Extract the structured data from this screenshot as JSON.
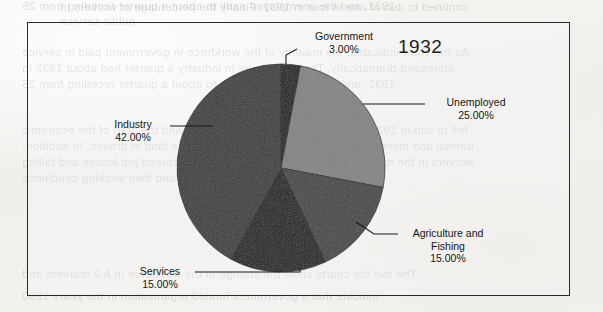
{
  "page": {
    "background_color": "#f4f3f1",
    "frame_color": "#2a2a2a"
  },
  "ghost_text": [
    "contined to duh of one in four in 1932. Finally the percentage of workers in",
    "public service",
    "As the chart indicates, the majority of the workforce in government paid in service",
    "increased dramatically. The percentage in industry  a quarter had about 1932 in",
    "1932,  and the unemployed sank to about a quarter receding from 25",
    "fell to sub in 1929, the year of the Wall Street crash and the start of the economic",
    "turmoil and more Jobless. Peasants were forced off the land in droves. In addition,",
    "workers in the manufacturing sector experienced widespread job losses and falling",
    "and their working conditions",
    "The two bie charts show the change of the workforce in A  2  markets and",
    "indicate that  a government funded organisation  in  the years 1990"
  ],
  "chart": {
    "title": "1932"
  },
  "chart_data": {
    "type": "pie",
    "title": "1932",
    "legend_position": "external-labels",
    "start_angle_deg": 0,
    "direction": "clockwise",
    "categories": [
      "Government",
      "Unemployed",
      "Agriculture and Fishing",
      "Services",
      "Industry"
    ],
    "values": [
      3,
      25,
      15,
      15,
      42
    ],
    "value_labels": [
      "3.00%",
      "25.00%",
      "15.00%",
      "15.00%",
      "42.00%"
    ],
    "unit": "%",
    "total": 100,
    "colors": [
      "#141414",
      "#838383",
      "#444444",
      "#1a1a1a",
      "#3a3a3a"
    ],
    "slices": [
      {
        "name": "Government",
        "label_lines": [
          "Government"
        ],
        "value": 3,
        "value_label": "3.00%",
        "color": "#141414"
      },
      {
        "name": "Unemployed",
        "label_lines": [
          "Unemployed"
        ],
        "value": 25,
        "value_label": "25.00%",
        "color": "#838383"
      },
      {
        "name": "Agriculture and Fishing",
        "label_lines": [
          "Agriculture and",
          "Fishing"
        ],
        "value": 15,
        "value_label": "15.00%",
        "color": "#444444"
      },
      {
        "name": "Services",
        "label_lines": [
          "Services"
        ],
        "value": 15,
        "value_label": "15.00%",
        "color": "#1a1a1a"
      },
      {
        "name": "Industry",
        "label_lines": [
          "Industry"
        ],
        "value": 42,
        "value_label": "42.00%",
        "color": "#3a3a3a"
      }
    ]
  },
  "labels": {
    "government": {
      "name": "Government",
      "pct": "3.00%"
    },
    "unemployed": {
      "name": "Unemployed",
      "pct": "25.00%"
    },
    "agriculture": {
      "line1": "Agriculture and",
      "line2": "Fishing",
      "pct": "15.00%"
    },
    "services": {
      "name": "Services",
      "pct": "15.00%"
    },
    "industry": {
      "name": "Industry",
      "pct": "42.00%"
    }
  }
}
